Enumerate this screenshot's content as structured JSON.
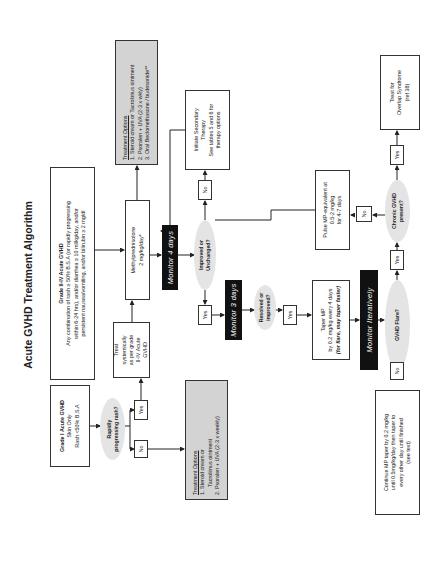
{
  "title": "Acute GVHD Treatment Algorithm",
  "nodes": {
    "grade1": {
      "heading": "Grade I Acute GVHD",
      "lines": [
        "Skin Only",
        "Rash <50% B.S.A"
      ]
    },
    "grade2to4": {
      "heading": "Grade II-IV Acute GVHD",
      "lines": [
        "Any combination of rash ≥ 50% B.S.A (or rapidly progressing",
        "within 6-24 hrs), and/or diarrhea ≥ 10 ml/kg/day, and/or",
        "persistent nausea/vomiting, and/or bilirubin ≥ 2 mg/dl"
      ]
    },
    "rapid_rash": {
      "lines": [
        "Rapidly",
        "progressing rash?"
      ]
    },
    "treat_systemically": {
      "lines": [
        "Treat",
        "systemically",
        "as per grade",
        "II-IV Acute",
        "GVHD"
      ]
    },
    "treatment_options_grade1": {
      "heading": "Treatment Options",
      "items": [
        "1. Steroid cream or",
        "    Tacrolimus ointment",
        "2. Psoralen + UVA (2-3 x weekly)"
      ]
    },
    "methylprednisolone": {
      "lines": [
        "Methylprednisolone",
        "2 mg/kg/day*"
      ]
    },
    "treatment_options_top": {
      "heading": "Treatment Options",
      "items": [
        "1. Steroid cream or Tacrolimus ointment",
        "2. Psoralen + UVA (2-3 x wkly)",
        "3. Oral Beclomethasone / budesonide**"
      ]
    },
    "monitor_4_days": "Monitor 4 days",
    "improved_unchanged": {
      "lines": [
        "Improved or",
        "Unchanged?"
      ]
    },
    "secondary_therapy": {
      "lines": [
        "Initiate Secondary",
        "Therapy",
        "See tables 5 and 6 for",
        "therapy options"
      ]
    },
    "monitor_3_days": "Monitor 3 days",
    "resolved_improved": {
      "lines": [
        "Resolved or",
        "improved?"
      ]
    },
    "taper_mp": {
      "lines": [
        "Taper MP",
        "by 0.2 mg/kg every 4 days"
      ],
      "emphasis": "(for flare, may taper faster)"
    },
    "monitor_iteratively": "Monitor Iteratively",
    "gvhd_flare": {
      "lines": [
        "GVHD Flare?"
      ]
    },
    "continue_mp": {
      "lines": [
        "Continue MP taper by 0.2 mg/kg",
        "until 0.5mg/kg/day then taper to",
        "every other day until finished",
        "(see text)"
      ]
    },
    "chronic_gvhd": {
      "lines": [
        "Chronic GVHD",
        "present?"
      ]
    },
    "pulse_mp": {
      "lines": [
        "Pulse MP-equivalent at",
        "0.5-2 mg/kg",
        "for 4-7 days"
      ]
    },
    "overlap": {
      "lines": [
        "Treat for",
        "Overlap Syndrome",
        "(ref 38)"
      ]
    }
  },
  "labels": {
    "yes": "Yes",
    "no": "No"
  },
  "colors": {
    "grey_box": "#d3d3d3",
    "monitor_box": "#111111",
    "decision_fill": "#e4e4e4",
    "line": "#222222"
  }
}
